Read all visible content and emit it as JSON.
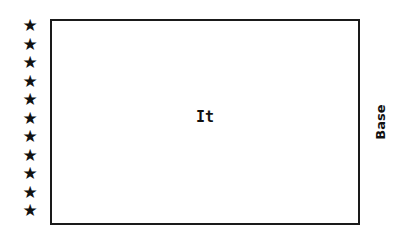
{
  "diagram": {
    "star_glyph": "★",
    "star_count": 11,
    "stars": [
      "★",
      "★",
      "★",
      "★",
      "★",
      "★",
      "★",
      "★",
      "★",
      "★",
      "★"
    ],
    "box_label": "It",
    "side_label": "Base"
  }
}
